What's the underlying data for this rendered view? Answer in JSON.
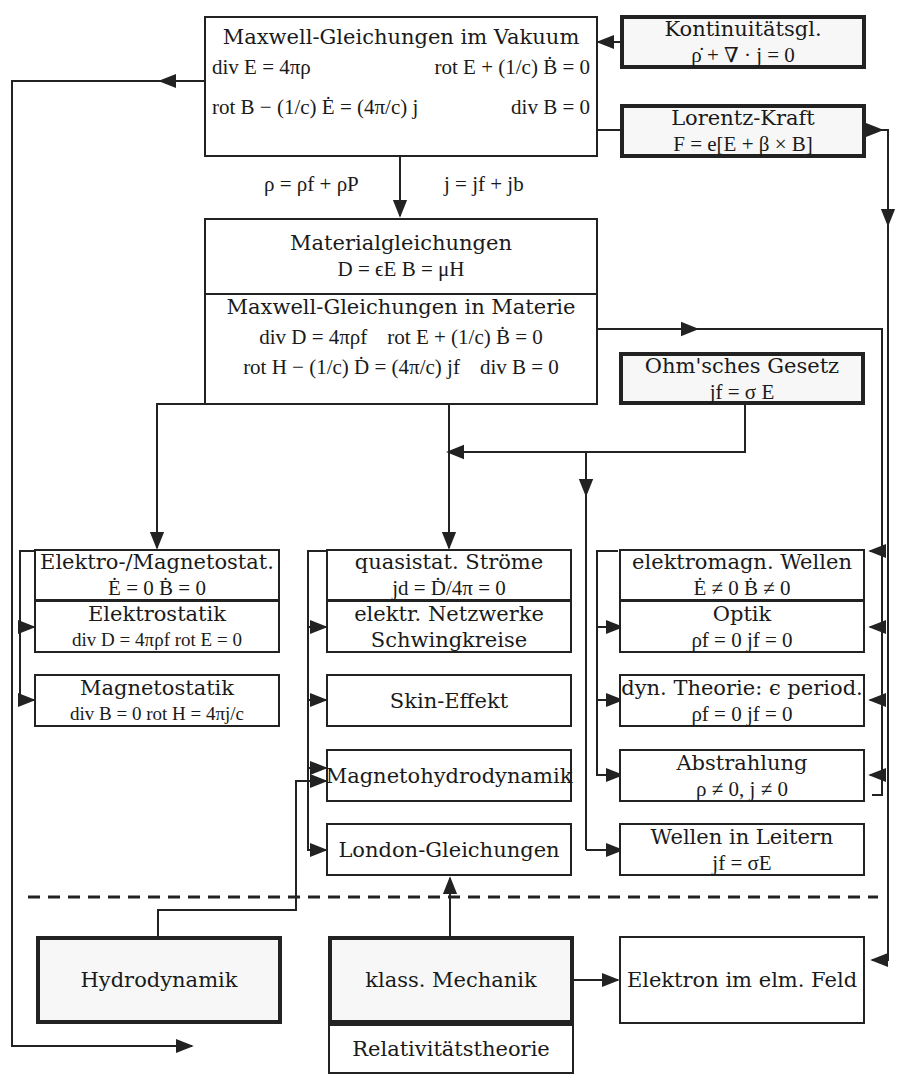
{
  "caption": "… Übersicht über die Elektrodynamik …",
  "boxes": {
    "maxwell_vakuum": {
      "title": "Maxwell-Gleichungen im Vakuum",
      "eq1": "div E = 4πρ",
      "eq2": "rot E + (1/c) Ḃ = 0",
      "eq3": "rot B − (1/c) Ė = (4π/c) j",
      "eq4": "div B = 0"
    },
    "kontinuitaet": {
      "title": "Kontinuitätsgl.",
      "eq": "ρ̇ + ∇ · j = 0"
    },
    "lorentz": {
      "title": "Lorentz-Kraft",
      "eq": "F = e[E + β × B]"
    },
    "split_labels": {
      "rho": "ρ = ρf + ρP",
      "j": "j = jf + jb"
    },
    "material": {
      "title": "Materialgleichungen",
      "eq": "D = ϵE    B = μH",
      "subtitle": "Maxwell-Gleichungen in Materie",
      "eq1": "div D = 4πρf",
      "eq2": "rot E + (1/c) Ḃ = 0",
      "eq3": "rot H − (1/c) Ḋ = (4π/c) jf",
      "eq4": "div B = 0"
    },
    "ohm": {
      "title": "Ohm'sches Gesetz",
      "eq": "jf = σ E"
    },
    "elektro_magnetostat": {
      "title": "Elektro-/Magnetostat.",
      "eq": "Ė = 0     Ḃ = 0"
    },
    "elektrostatik": {
      "title": "Elektrostatik",
      "eq": "div D = 4πρf  rot E = 0"
    },
    "magnetostatik": {
      "title": "Magnetostatik",
      "eq": "div B = 0  rot H = 4πj/c"
    },
    "quasistat": {
      "title": "quasistat. Ströme",
      "eq": "jd = Ḋ/4π = 0"
    },
    "netzwerke": {
      "title": "elektr. Netzwerke",
      "title2": "Schwingkreise"
    },
    "skin": {
      "title": "Skin-Effekt"
    },
    "mhd": {
      "title": "Magnetohydrodynamik"
    },
    "london": {
      "title": "London-Gleichungen"
    },
    "wellen": {
      "title": "elektromagn. Wellen",
      "eq": "Ė ≠ 0     Ḃ ≠ 0"
    },
    "optik": {
      "title": "Optik",
      "eq": "ρf = 0   jf = 0"
    },
    "dyn_theorie": {
      "title": "dyn. Theorie: ϵ period.",
      "eq": "ρf = 0   jf = 0"
    },
    "abstrahlung": {
      "title": "Abstrahlung",
      "eq": "ρ ≠ 0,  j ≠ 0"
    },
    "wellen_leiter": {
      "title": "Wellen in Leitern",
      "eq": "jf = σE"
    },
    "hydrodynamik": {
      "title": "Hydrodynamik"
    },
    "mechanik": {
      "title": "klass. Mechanik"
    },
    "elektron": {
      "title": "Elektron im elm. Feld"
    },
    "relativitaet": {
      "title": "Relativitätstheorie"
    }
  },
  "colors": {
    "line": "#222222",
    "thick_fill": "#f7f7f7",
    "box_fill": "#ffffff"
  }
}
